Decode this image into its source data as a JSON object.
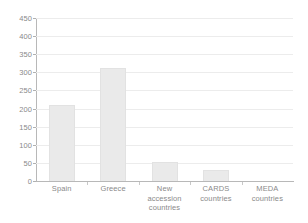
{
  "chart_data": {
    "type": "bar",
    "title": "",
    "subtitle": "",
    "xlabel": "",
    "ylabel": "",
    "categories": [
      "Spain",
      "Greece",
      "New accession countries",
      "CARDS countries",
      "MEDA countries"
    ],
    "category_lines": [
      [
        "Spain"
      ],
      [
        "Greece"
      ],
      [
        "New",
        "accession",
        "countries"
      ],
      [
        "CARDS",
        "countries"
      ],
      [
        "MEDA",
        "countries"
      ]
    ],
    "values": [
      210,
      313,
      53,
      30,
      0
    ],
    "ylim": [
      0,
      450
    ],
    "ytick_step": 50,
    "yticks": [
      450,
      400,
      350,
      300,
      250,
      200,
      150,
      100,
      50,
      0
    ],
    "ytick_labels": [
      "450",
      "400",
      "350",
      "300",
      "250",
      "200",
      "150",
      "100",
      "50",
      "0"
    ],
    "grid": true,
    "grid_axis": "y",
    "legend": false,
    "legend_position": "none",
    "annotations": []
  },
  "style": {
    "background": "#ffffff",
    "bar_fill": "#eaeaea",
    "bar_edge": "#e2e2e2",
    "gridline_color": "#ececec",
    "axis_color": "#b8b8b8",
    "text_color": "#8a8a8a"
  }
}
